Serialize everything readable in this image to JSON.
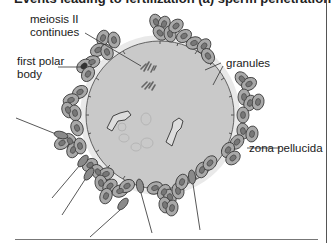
{
  "figure": {
    "title": "Events leading to fertilization (a) sperm penetration",
    "labels": {
      "meiosis": [
        "meiosis II",
        "continues"
      ],
      "polar_body": [
        "first polar",
        "body"
      ],
      "granules": "granules",
      "zona": "zona pellucida"
    },
    "colors": {
      "egg_fill": "#c9c9c9",
      "zona_fill": "#e6e6e6",
      "follicle_fill": "#a9a9a9",
      "nucleus_fill": "#7a7a7a",
      "outline": "#333333",
      "sperm_head": "#8a8a8a"
    }
  }
}
